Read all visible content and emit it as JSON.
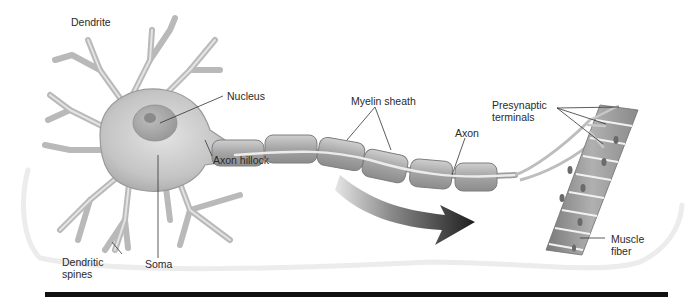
{
  "diagram": {
    "type": "anatomy",
    "labels": {
      "dendrite": "Dendrite",
      "nucleus": "Nucleus",
      "myelin_sheath": "Myelin sheath",
      "axon_hillock": "Axon hillock",
      "axon": "Axon",
      "presynaptic_line1": "Presynaptic",
      "presynaptic_line2": "terminals",
      "dendritic_spines_line1": "Dendritic",
      "dendritic_spines_line2": "spines",
      "soma": "Soma",
      "muscle_fiber_line1": "Muscle",
      "muscle_fiber_line2": "fiber"
    },
    "colors": {
      "cell_fill": "#c9c9c9",
      "cell_outline": "#8a8a8a",
      "myelin_fill": "#a9a9a9",
      "arrow": "#2a2a2a",
      "muscle": "#8f8f8f",
      "bottom_bar": "#111111"
    }
  }
}
